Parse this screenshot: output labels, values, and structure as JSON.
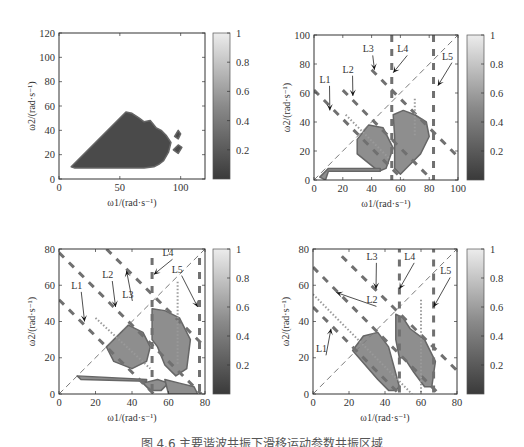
{
  "figure": {
    "caption": "图 4.6   主要谐波共振下滑移运动参数共振区域"
  },
  "chart_data": [
    {
      "id": "a",
      "type": "heatmap",
      "title": "",
      "xlabel": "ω1/(rad·s⁻¹)",
      "ylabel": "ω2/(rad·s⁻¹)",
      "xlim": [
        0,
        120
      ],
      "ylim": [
        0,
        120
      ],
      "xticks": [
        0,
        50,
        100
      ],
      "yticks": [
        0,
        20,
        40,
        60,
        80,
        100,
        120
      ],
      "colorbar": {
        "range": [
          0,
          1
        ],
        "ticks": [
          0.2,
          0.4,
          0.6,
          0.8,
          1
        ],
        "tick_labels": [
          "0.2",
          "0.4",
          "0.6",
          "0.8",
          "1"
        ]
      },
      "region": {
        "description": "Dark triangular region (value ≈ 0) bounded by ω2 = ω1 diagonal, ω2 ≈ 10 bottom, scalloped right edge",
        "polygon": [
          [
            10,
            10
          ],
          [
            55,
            55
          ],
          [
            60,
            54
          ],
          [
            66,
            50
          ],
          [
            70,
            47
          ],
          [
            75,
            48
          ],
          [
            80,
            42
          ],
          [
            84,
            40
          ],
          [
            88,
            36
          ],
          [
            92,
            30
          ],
          [
            90,
            22
          ],
          [
            86,
            15
          ],
          [
            82,
            12
          ],
          [
            78,
            10
          ],
          [
            70,
            9
          ],
          [
            13,
            9
          ]
        ],
        "islands": [
          [
            [
              95,
              35
            ],
            [
              98,
              40
            ],
            [
              100,
              37
            ],
            [
              98,
              33
            ]
          ],
          [
            [
              94,
              24
            ],
            [
              98,
              28
            ],
            [
              101,
              26
            ],
            [
              98,
              21
            ]
          ]
        ],
        "value": 0.0
      },
      "lines": [],
      "annotations": []
    },
    {
      "id": "b",
      "type": "heatmap",
      "xlabel": "ω1/(rad·s⁻¹)",
      "ylabel": "ω2/(rad·s⁻¹)",
      "xlim": [
        0,
        100
      ],
      "ylim": [
        0,
        100
      ],
      "xticks": [
        0,
        20,
        40,
        60,
        80,
        100
      ],
      "xtick_labels": [
        "0",
        "20",
        "40",
        "60",
        "80",
        "100"
      ],
      "yticks": [
        0,
        20,
        40,
        60,
        80,
        100
      ],
      "colorbar": {
        "range": [
          0,
          1
        ],
        "ticks": [
          0.2,
          0.4,
          0.6,
          0.8,
          1
        ],
        "tick_labels": [
          "0.2",
          "0.4",
          "0.6",
          "0.8",
          "1"
        ]
      },
      "region": {
        "polygons": [
          [
            [
              30,
              28
            ],
            [
              38,
              38
            ],
            [
              48,
              36
            ],
            [
              55,
              22
            ],
            [
              50,
              8
            ],
            [
              45,
              6
            ],
            [
              30,
              18
            ]
          ],
          [
            [
              55,
              45
            ],
            [
              62,
              48
            ],
            [
              70,
              45
            ],
            [
              78,
              40
            ],
            [
              80,
              30
            ],
            [
              74,
              18
            ],
            [
              66,
              10
            ],
            [
              60,
              4
            ],
            [
              56,
              8
            ],
            [
              56,
              30
            ]
          ],
          [
            [
              4,
              2
            ],
            [
              10,
              8
            ],
            [
              46,
              8
            ],
            [
              46,
              6
            ],
            [
              10,
              6
            ],
            [
              8,
              0
            ]
          ]
        ],
        "value": 0.55
      },
      "lines": [
        {
          "name": "diag",
          "style": "dashed-thin",
          "points": [
            [
              0,
              0
            ],
            [
              100,
              100
            ]
          ]
        },
        {
          "name": "L1",
          "style": "dashed-thick",
          "points": [
            [
              0,
              62
            ],
            [
              62,
              0
            ]
          ]
        },
        {
          "name": "L2",
          "style": "dashed-thick",
          "points": [
            [
              20,
              62
            ],
            [
              82,
              0
            ]
          ]
        },
        {
          "name": "L3",
          "style": "dashed-thick",
          "points": [
            [
              40,
              76
            ],
            [
              100,
              16
            ]
          ]
        },
        {
          "name": "L4",
          "style": "dashed-thick",
          "points": [
            [
              54,
              100
            ],
            [
              54,
              0
            ]
          ]
        },
        {
          "name": "L5",
          "style": "dashed-thick",
          "points": [
            [
              83,
              100
            ],
            [
              83,
              0
            ]
          ]
        },
        {
          "name": "dot1",
          "style": "dotted",
          "points": [
            [
              22,
              45
            ],
            [
              52,
              15
            ]
          ]
        },
        {
          "name": "dot2",
          "style": "dotted",
          "points": [
            [
              70,
              56
            ],
            [
              70,
              30
            ]
          ]
        }
      ],
      "annotations": [
        {
          "label": "L1",
          "text_at": [
            8,
            67
          ],
          "arrow_to": [
            11,
            48
          ]
        },
        {
          "label": "L2",
          "text_at": [
            24,
            74
          ],
          "arrow_to": [
            27,
            58
          ]
        },
        {
          "label": "L3",
          "text_at": [
            38,
            88
          ],
          "arrow_to": [
            42,
            76
          ]
        },
        {
          "label": "L4",
          "text_at": [
            62,
            88
          ],
          "arrow_to": [
            55,
            74
          ]
        },
        {
          "label": "L5",
          "text_at": [
            93,
            83
          ],
          "arrow_to": [
            86,
            65
          ]
        }
      ]
    },
    {
      "id": "c",
      "type": "heatmap",
      "xlabel": "ω1/(rad·s⁻¹)",
      "ylabel": "ω2/(rad·s⁻¹)",
      "xlim": [
        0,
        80
      ],
      "ylim": [
        0,
        80
      ],
      "xticks": [
        0,
        20,
        40,
        60,
        80
      ],
      "yticks": [
        0,
        20,
        40,
        60,
        80
      ],
      "colorbar": {
        "range": [
          0,
          1
        ],
        "ticks": [
          0.2,
          0.4,
          0.6,
          0.8,
          1
        ],
        "tick_labels": [
          "0.2",
          "0.4",
          "0.6",
          "0.8",
          "1"
        ]
      },
      "region": {
        "polygons": [
          [
            [
              26,
              26
            ],
            [
              38,
              38
            ],
            [
              46,
              34
            ],
            [
              50,
              26
            ],
            [
              48,
              18
            ],
            [
              40,
              14
            ],
            [
              30,
              18
            ]
          ],
          [
            [
              51,
              47
            ],
            [
              58,
              46
            ],
            [
              66,
              42
            ],
            [
              72,
              30
            ],
            [
              70,
              14
            ],
            [
              64,
              10
            ],
            [
              58,
              16
            ],
            [
              54,
              26
            ],
            [
              51,
              30
            ]
          ],
          [
            [
              10,
              10
            ],
            [
              48,
              8
            ],
            [
              48,
              7
            ],
            [
              12,
              8
            ]
          ],
          [
            [
              46,
              6
            ],
            [
              50,
              2
            ],
            [
              56,
              2
            ],
            [
              60,
              6
            ],
            [
              54,
              8
            ]
          ],
          [
            [
              58,
              8
            ],
            [
              66,
              6
            ],
            [
              74,
              4
            ],
            [
              76,
              0
            ],
            [
              60,
              0
            ]
          ]
        ],
        "value": 0.55
      },
      "lines": [
        {
          "name": "diag",
          "style": "dashed-thin",
          "points": [
            [
              0,
              0
            ],
            [
              80,
              80
            ]
          ]
        },
        {
          "name": "L1",
          "style": "dashed-thick",
          "points": [
            [
              0,
              52
            ],
            [
              52,
              0
            ]
          ]
        },
        {
          "name": "L2",
          "style": "dashed-thick",
          "points": [
            [
              0,
              78
            ],
            [
              78,
              0
            ]
          ]
        },
        {
          "name": "L3",
          "style": "dashed-thick",
          "points": [
            [
              26,
              80
            ],
            [
              100,
              6
            ]
          ]
        },
        {
          "name": "L4",
          "style": "dashed-thick",
          "points": [
            [
              51,
              75
            ],
            [
              51,
              0
            ]
          ]
        },
        {
          "name": "L5",
          "style": "dashed-thick",
          "points": [
            [
              77,
              75
            ],
            [
              77,
              0
            ]
          ]
        },
        {
          "name": "dot1",
          "style": "dotted",
          "points": [
            [
              20,
              42
            ],
            [
              50,
              14
            ]
          ]
        },
        {
          "name": "dot2",
          "style": "dotted",
          "points": [
            [
              65,
              62
            ],
            [
              65,
              16
            ]
          ]
        }
      ],
      "annotations": [
        {
          "label": "L1",
          "text_at": [
            10,
            58
          ],
          "arrow_to": [
            14,
            40
          ]
        },
        {
          "label": "L2",
          "text_at": [
            27,
            64
          ],
          "arrow_to": [
            31,
            48
          ]
        },
        {
          "label": "L3",
          "text_at": [
            38,
            53
          ],
          "arrow_to": [
            37,
            68
          ]
        },
        {
          "label": "L4",
          "text_at": [
            60,
            76
          ],
          "arrow_to": [
            52,
            66
          ]
        },
        {
          "label": "L5",
          "text_at": [
            65,
            67
          ],
          "arrow_to": [
            76,
            48
          ]
        }
      ]
    },
    {
      "id": "d",
      "type": "heatmap",
      "xlabel": "ω1/(rad·s⁻¹)",
      "ylabel": "ω2/(rad·s⁻¹)",
      "xlim": [
        0,
        80
      ],
      "ylim": [
        0,
        80
      ],
      "xticks": [
        0,
        20,
        40,
        60,
        80
      ],
      "yticks": [
        0,
        20,
        40,
        60,
        80
      ],
      "colorbar": {
        "range": [
          0,
          1
        ],
        "ticks": [
          0.2,
          0.4,
          0.6,
          0.8,
          1
        ],
        "tick_labels": [
          "0.2",
          "0.4",
          "0.6",
          "0.8",
          "1"
        ]
      },
      "region": {
        "polygons": [
          [
            [
              22,
              24
            ],
            [
              28,
              32
            ],
            [
              36,
              34
            ],
            [
              42,
              26
            ],
            [
              48,
              4
            ],
            [
              46,
              2
            ],
            [
              42,
              2
            ],
            [
              36,
              8
            ]
          ],
          [
            [
              46,
              44
            ],
            [
              50,
              42
            ],
            [
              54,
              36
            ],
            [
              62,
              30
            ],
            [
              68,
              18
            ],
            [
              66,
              4
            ],
            [
              62,
              4
            ],
            [
              56,
              12
            ],
            [
              52,
              18
            ],
            [
              50,
              20
            ],
            [
              48,
              20
            ],
            [
              46,
              30
            ]
          ]
        ],
        "value": 0.6
      },
      "lines": [
        {
          "name": "diag",
          "style": "dashed-thin",
          "points": [
            [
              0,
              0
            ],
            [
              80,
              80
            ]
          ]
        },
        {
          "name": "L1",
          "style": "dashed-thick",
          "points": [
            [
              0,
              48
            ],
            [
              48,
              0
            ]
          ]
        },
        {
          "name": "L2",
          "style": "dashed-thick",
          "points": [
            [
              0,
              70
            ],
            [
              70,
              0
            ]
          ]
        },
        {
          "name": "L3",
          "style": "dashed-thick",
          "points": [
            [
              16,
              76
            ],
            [
              85,
              8
            ]
          ]
        },
        {
          "name": "L4",
          "style": "dashed-thick",
          "points": [
            [
              48,
              82
            ],
            [
              48,
              0
            ]
          ]
        },
        {
          "name": "L5",
          "style": "dashed-thick",
          "points": [
            [
              67,
              82
            ],
            [
              67,
              0
            ]
          ]
        },
        {
          "name": "dot1",
          "style": "dotted",
          "points": [
            [
              0,
              55
            ],
            [
              55,
              0
            ]
          ]
        },
        {
          "name": "dot2",
          "style": "dotted",
          "points": [
            [
              60,
              52
            ],
            [
              60,
              0
            ]
          ]
        }
      ],
      "annotations": [
        {
          "label": "L1",
          "text_at": [
            5,
            23
          ],
          "arrow_to": [
            10,
            36
          ]
        },
        {
          "label": "L2",
          "text_at": [
            33,
            50
          ],
          "arrow_to": [
            13,
            56
          ]
        },
        {
          "label": "L3",
          "text_at": [
            33,
            74
          ],
          "arrow_to": [
            35,
            58
          ]
        },
        {
          "label": "L4",
          "text_at": [
            54,
            74
          ],
          "arrow_to": [
            48,
            58
          ]
        },
        {
          "label": "L5",
          "text_at": [
            74,
            66
          ],
          "arrow_to": [
            67,
            48
          ]
        }
      ]
    }
  ]
}
